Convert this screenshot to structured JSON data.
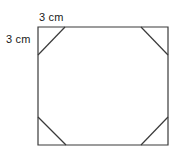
{
  "figure": {
    "background_color": "#ffffff",
    "stroke_color": "#3a3a3a",
    "stroke_width": 1.2,
    "square": {
      "left": 38,
      "top": 27,
      "right": 168,
      "bottom": 145,
      "width": 130,
      "height": 118
    },
    "corner_cut": {
      "horizontal_leg": 27,
      "vertical_leg": 28
    },
    "labels": [
      {
        "id": "top-cut-length",
        "text": "3 cm",
        "x": 39,
        "y": 11,
        "measures": "horizontal leg of top-left corner cut"
      },
      {
        "id": "left-cut-length",
        "text": "3 cm",
        "x": 6,
        "y": 33,
        "measures": "vertical leg of top-left corner cut"
      }
    ],
    "outline_points": "38,55 65,27 141,27 168,55 168,117 141,145 66,145 38,117",
    "square_path": "M38,27 L168,27 L168,145 L38,145 Z",
    "cut_lines": [
      {
        "id": "top-left-cut",
        "x1": 38,
        "y1": 55,
        "x2": 65,
        "y2": 27
      },
      {
        "id": "top-right-cut",
        "x1": 141,
        "y1": 27,
        "x2": 168,
        "y2": 55
      },
      {
        "id": "bottom-right-cut",
        "x1": 168,
        "y1": 117,
        "x2": 141,
        "y2": 145
      },
      {
        "id": "bottom-left-cut",
        "x1": 66,
        "y1": 145,
        "x2": 38,
        "y2": 117
      }
    ]
  }
}
